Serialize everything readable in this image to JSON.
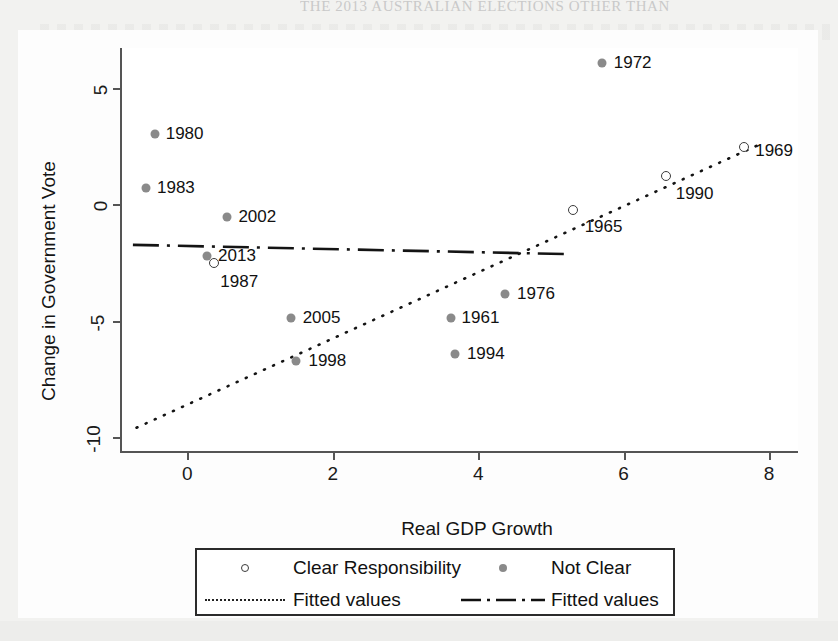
{
  "page": {
    "bleed_title": "THE 2013 AUSTRALIAN ELECTIONS OTHER THAN"
  },
  "chart_data": {
    "type": "scatter",
    "title": "",
    "xlabel": "Real GDP Growth",
    "ylabel": "Change in Government Vote",
    "xlim": [
      -0.9,
      8.4
    ],
    "ylim": [
      -10.6,
      6.7
    ],
    "xticks": [
      0,
      2,
      4,
      6,
      8
    ],
    "yticks": [
      5,
      0,
      -5,
      -10
    ],
    "xtick_labels": [
      "0",
      "2",
      "4",
      "6",
      "8"
    ],
    "ytick_labels": [
      "5",
      "0",
      "-5",
      "-10"
    ],
    "grid": false,
    "legend_position": "below-plot",
    "series": [
      {
        "name": "Clear Responsibility",
        "marker": "open-circle",
        "color": "#3b3b3b",
        "points": [
          {
            "label": "1987",
            "x": 0.37,
            "y": -2.55,
            "label_dx": 6,
            "label_dy": 19
          },
          {
            "label": "1965",
            "x": 5.3,
            "y": -0.25,
            "label_dx": 12,
            "label_dy": 17
          },
          {
            "label": "1990",
            "x": 6.58,
            "y": 1.2,
            "label_dx": 10,
            "label_dy": 18
          },
          {
            "label": "1969",
            "x": 7.66,
            "y": 2.45,
            "label_dx": 11,
            "label_dy": 4
          }
        ]
      },
      {
        "name": "Not Clear",
        "marker": "filled-circle",
        "color": "#8a8a8a",
        "points": [
          {
            "label": "1980",
            "x": -0.45,
            "y": 3.0,
            "label_dx": 11,
            "label_dy": 0
          },
          {
            "label": "1983",
            "x": -0.57,
            "y": 0.7,
            "label_dx": 11,
            "label_dy": 0
          },
          {
            "label": "2002",
            "x": 0.55,
            "y": -0.55,
            "label_dx": 11,
            "label_dy": 0
          },
          {
            "label": "2013",
            "x": 0.27,
            "y": -2.25,
            "label_dx": 11,
            "label_dy": 0
          },
          {
            "label": "1972",
            "x": 5.7,
            "y": 6.05,
            "label_dx": 12,
            "label_dy": 0
          },
          {
            "label": "1976",
            "x": 4.37,
            "y": -3.85,
            "label_dx": 12,
            "label_dy": 0
          },
          {
            "label": "1961",
            "x": 3.62,
            "y": -4.9,
            "label_dx": 11,
            "label_dy": 0
          },
          {
            "label": "2005",
            "x": 1.42,
            "y": -4.88,
            "label_dx": 12,
            "label_dy": 0
          },
          {
            "label": "1994",
            "x": 3.68,
            "y": -6.45,
            "label_dx": 12,
            "label_dy": 0
          },
          {
            "label": "1998",
            "x": 1.5,
            "y": -6.75,
            "label_dx": 12,
            "label_dy": 0
          }
        ]
      }
    ],
    "fits": [
      {
        "name": "Fitted values",
        "style": "dotted",
        "for_series": "Clear Responsibility",
        "x_start": -0.7,
        "y_start": -9.6,
        "x_end": 7.9,
        "y_end": 2.6
      },
      {
        "name": "Fitted values",
        "style": "dash-dot",
        "for_series": "Not Clear",
        "x_start": -0.75,
        "y_start": -1.75,
        "x_end": 5.25,
        "y_end": -2.15
      }
    ]
  },
  "legend": {
    "entries": [
      {
        "key": "open-circle",
        "label": "Clear Responsibility"
      },
      {
        "key": "filled-circle",
        "label": "Not Clear"
      },
      {
        "key": "dotted-line",
        "label": "Fitted values"
      },
      {
        "key": "dashdot-line",
        "label": "Fitted values"
      }
    ]
  }
}
